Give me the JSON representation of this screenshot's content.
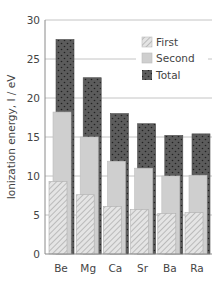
{
  "chart_data": {
    "type": "bar",
    "title": "",
    "xlabel": "",
    "ylabel": "Ionization energy, I / eV",
    "ylim": [
      0,
      30
    ],
    "yticks": [
      0,
      5,
      10,
      15,
      20,
      25,
      30
    ],
    "grid": true,
    "legend_position": "upper right",
    "categories": [
      "Be",
      "Mg",
      "Ca",
      "Sr",
      "Ba",
      "Ra"
    ],
    "series": [
      {
        "name": "First",
        "values": [
          9.3,
          7.6,
          6.1,
          5.7,
          5.2,
          5.3
        ],
        "pattern": "hatch",
        "color": "#d9d9d9"
      },
      {
        "name": "Second",
        "values": [
          18.2,
          15.0,
          11.9,
          11.0,
          10.0,
          10.1
        ],
        "pattern": "solid",
        "color": "#cfcfcf"
      },
      {
        "name": "Total",
        "values": [
          27.5,
          22.6,
          18.0,
          16.7,
          15.2,
          15.4
        ],
        "pattern": "dots",
        "color": "#5a5a5a"
      }
    ]
  },
  "legend": {
    "items": [
      {
        "label": "First"
      },
      {
        "label": "Second"
      },
      {
        "label": "Total"
      }
    ]
  }
}
